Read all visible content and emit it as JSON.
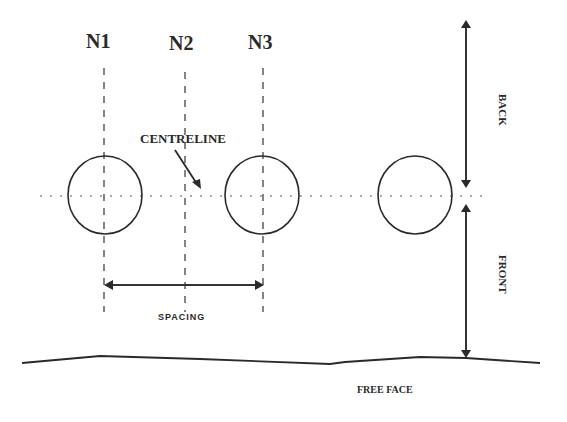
{
  "diagram": {
    "hole_labels": [
      "N1",
      "N2",
      "N3"
    ],
    "centreline_label": "CENTRELINE",
    "spacing_label": "SPACING",
    "back_label": "BACK",
    "front_label": "FRONT",
    "free_face_label": "FREE FACE",
    "colors": {
      "ink": "#2a2a2a",
      "background": "#ffffff"
    }
  }
}
